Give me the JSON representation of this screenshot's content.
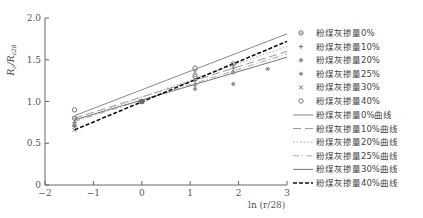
{
  "chart_data": {
    "type": "scatter",
    "title": "",
    "xlabel": "ln (r/28)",
    "ylabel": "Rc/Rc28",
    "xlim": [
      -2,
      3
    ],
    "ylim": [
      0,
      2.0
    ],
    "x_ticks": [
      "−2",
      "−1",
      "0",
      "1",
      "2",
      "3"
    ],
    "y_ticks": [
      "0",
      "0.5",
      "1.0",
      "1.5",
      "2.0"
    ],
    "grid": false,
    "legend_position": "right",
    "series": [
      {
        "name": "粉煤灰掺量0%",
        "marker": "circle-cross",
        "x": [
          -1.39,
          0,
          1.1,
          1.89
        ],
        "y": [
          0.8,
          1.0,
          1.3,
          1.45
        ]
      },
      {
        "name": "粉煤灰掺量10%",
        "marker": "plus",
        "x": [
          -1.39,
          0,
          1.1,
          1.89
        ],
        "y": [
          0.75,
          1.0,
          1.25,
          1.4
        ]
      },
      {
        "name": "粉煤灰掺量20%",
        "marker": "diamond",
        "x": [
          -1.39,
          0,
          1.1,
          1.89
        ],
        "y": [
          0.72,
          1.0,
          1.2,
          1.35
        ]
      },
      {
        "name": "粉煤灰掺量25%",
        "marker": "asterisk",
        "x": [
          -1.39,
          0,
          1.1,
          1.89,
          2.6
        ],
        "y": [
          0.7,
          1.0,
          1.15,
          1.21,
          1.39
        ]
      },
      {
        "name": "粉煤灰掺量30%",
        "marker": "x",
        "x": [
          -1.39,
          0,
          1.1
        ],
        "y": [
          0.66,
          1.0,
          1.35
        ]
      },
      {
        "name": "粉煤灰掺量40%",
        "marker": "circle",
        "x": [
          -1.39,
          0,
          1.1
        ],
        "y": [
          0.9,
          1.0,
          1.4
        ]
      }
    ],
    "fit_lines": [
      {
        "name": "粉煤灰掺量0%曲线",
        "style": "solid",
        "x": [
          -1.39,
          3
        ],
        "y": [
          0.83,
          1.81
        ]
      },
      {
        "name": "粉煤灰掺量10%曲线",
        "style": "long-dash",
        "x": [
          -1.39,
          3
        ],
        "y": [
          0.8,
          1.6
        ]
      },
      {
        "name": "粉煤灰掺量20%曲线",
        "style": "dotted",
        "x": [
          -1.39,
          3
        ],
        "y": [
          0.77,
          1.66
        ]
      },
      {
        "name": "粉煤灰掺量25%曲线",
        "style": "dash-dot",
        "x": [
          -1.39,
          3
        ],
        "y": [
          0.76,
          1.57
        ]
      },
      {
        "name": "粉煤灰掺量30%曲线",
        "style": "solid-gray",
        "x": [
          -1.39,
          3
        ],
        "y": [
          0.78,
          1.53
        ]
      },
      {
        "name": "粉煤灰掺量40%曲线",
        "style": "bold-dash",
        "x": [
          -1.39,
          3
        ],
        "y": [
          0.66,
          1.72
        ]
      }
    ]
  },
  "legend": {
    "markers": [
      {
        "symbol": "⊕",
        "label": "粉煤灰掺量0%"
      },
      {
        "symbol": "+",
        "label": "粉煤灰掺量10%"
      },
      {
        "symbol": "◆",
        "label": "粉煤灰掺量20%"
      },
      {
        "symbol": "✱",
        "label": "粉煤灰掺量25%"
      },
      {
        "symbol": "×",
        "label": "粉煤灰掺量30%"
      },
      {
        "symbol": "○",
        "label": "粉煤灰掺量40%"
      }
    ],
    "lines": [
      {
        "label": "粉煤灰掺量0%曲线"
      },
      {
        "label": "粉煤灰掺量10%曲线"
      },
      {
        "label": "粉煤灰掺量20%曲线"
      },
      {
        "label": "粉煤灰掺量25%曲线"
      },
      {
        "label": "粉煤灰掺量30%曲线"
      },
      {
        "label": "粉煤灰掺量40%曲线"
      }
    ]
  },
  "axes": {
    "xlabel": "ln (r/28)",
    "ylabel_main": "R",
    "ylabel_sub1": "c",
    "ylabel_div": "/R",
    "ylabel_sub2": "c28"
  }
}
